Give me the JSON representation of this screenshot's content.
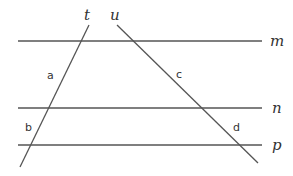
{
  "diagram": {
    "parallel_lines": [
      {
        "name": "m",
        "y": 41,
        "x1": 18,
        "x2": 262
      },
      {
        "name": "n",
        "y": 108,
        "x1": 18,
        "x2": 262
      },
      {
        "name": "p",
        "y": 145,
        "x1": 18,
        "x2": 262
      }
    ],
    "transversals": [
      {
        "name": "t",
        "x1": 89,
        "y1": 25,
        "x2": 20,
        "y2": 167
      },
      {
        "name": "u",
        "x1": 117,
        "y1": 25,
        "x2": 258,
        "y2": 163
      }
    ],
    "segment_labels": [
      {
        "text": "a",
        "x": 48,
        "y": 79
      },
      {
        "text": "b",
        "x": 25,
        "y": 131
      },
      {
        "text": "c",
        "x": 178,
        "y": 78
      },
      {
        "text": "d",
        "x": 233,
        "y": 131
      }
    ],
    "line_labels": {
      "m": "m",
      "n": "n",
      "p": "p",
      "t": "t",
      "u": "u"
    }
  }
}
